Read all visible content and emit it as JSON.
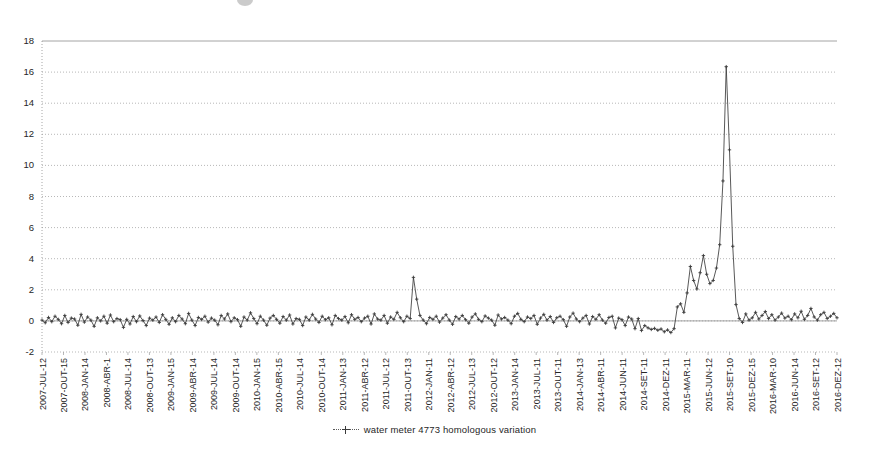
{
  "chart_data": {
    "type": "line",
    "title": "",
    "xlabel": "",
    "ylabel": "",
    "ylim": [
      -2,
      18
    ],
    "yticks": [
      -2,
      0,
      2,
      4,
      6,
      8,
      10,
      12,
      14,
      16,
      18
    ],
    "grid": true,
    "legend_position": "bottom",
    "series": [
      {
        "name": "water meter 4773 homologous variation",
        "marker": "cross",
        "color": "#3b3b3b",
        "values": [
          0.05,
          -0.12,
          0.22,
          -0.05,
          0.3,
          0.1,
          -0.18,
          0.35,
          -0.1,
          0.18,
          0.12,
          -0.28,
          0.42,
          -0.08,
          0.25,
          0.05,
          -0.35,
          0.2,
          0.0,
          0.3,
          -0.15,
          0.38,
          -0.05,
          0.15,
          0.08,
          -0.42,
          0.1,
          -0.2,
          0.28,
          -0.05,
          0.32,
          0.02,
          -0.3,
          0.18,
          0.05,
          0.25,
          -0.1,
          0.4,
          0.1,
          -0.22,
          0.2,
          -0.05,
          0.35,
          0.12,
          -0.18,
          0.48,
          0.05,
          -0.3,
          0.22,
          0.1,
          0.3,
          -0.08,
          0.18,
          0.05,
          -0.25,
          0.35,
          0.12,
          0.45,
          -0.05,
          0.2,
          0.08,
          -0.35,
          0.25,
          0.05,
          0.52,
          0.15,
          -0.18,
          0.3,
          0.05,
          -0.28,
          0.18,
          0.35,
          0.1,
          -0.15,
          0.28,
          0.05,
          0.38,
          -0.2,
          0.15,
          0.1,
          -0.3,
          0.25,
          0.05,
          0.42,
          0.12,
          -0.1,
          0.3,
          0.08,
          0.2,
          -0.25,
          0.35,
          0.15,
          0.05,
          0.28,
          -0.12,
          0.4,
          0.1,
          0.22,
          -0.05,
          0.18,
          0.3,
          -0.2,
          0.45,
          0.12,
          0.05,
          0.35,
          -0.15,
          0.25,
          0.1,
          0.55,
          0.2,
          -0.05,
          0.3,
          0.15,
          2.8,
          1.4,
          0.35,
          0.05,
          -0.18,
          0.22,
          0.1,
          0.3,
          -0.08,
          0.18,
          0.4,
          0.05,
          -0.22,
          0.28,
          0.12,
          0.35,
          0.08,
          -0.15,
          0.25,
          0.45,
          0.1,
          -0.05,
          0.32,
          0.18,
          0.05,
          -0.28,
          0.38,
          0.12,
          0.22,
          0.05,
          -0.18,
          0.3,
          0.48,
          0.1,
          -0.05,
          0.25,
          0.15,
          0.35,
          -0.22,
          0.18,
          0.42,
          0.05,
          0.28,
          -0.1,
          0.2,
          0.3,
          0.08,
          -0.35,
          0.25,
          0.5,
          0.12,
          -0.05,
          0.18,
          0.35,
          -0.2,
          0.28,
          0.1,
          0.4,
          0.05,
          -0.15,
          0.22,
          0.3,
          -0.45,
          0.18,
          0.08,
          -0.3,
          0.25,
          0.12,
          -0.5,
          0.15,
          -0.62,
          -0.3,
          -0.45,
          -0.55,
          -0.48,
          -0.6,
          -0.52,
          -0.7,
          -0.58,
          -0.75,
          -0.5,
          0.9,
          1.1,
          0.55,
          1.8,
          3.5,
          2.6,
          2.05,
          3.1,
          4.2,
          3.0,
          2.4,
          2.6,
          3.4,
          4.9,
          9.0,
          16.35,
          11.0,
          4.8,
          1.05,
          0.15,
          -0.1,
          0.45,
          0.05,
          0.2,
          0.55,
          0.12,
          0.35,
          0.6,
          0.15,
          0.4,
          0.05,
          0.25,
          0.5,
          0.18,
          0.3,
          0.08,
          0.45,
          0.2,
          0.62,
          0.1,
          0.35,
          0.8,
          0.25,
          0.05,
          0.4,
          0.55,
          0.15,
          0.3,
          0.48,
          0.2
        ]
      }
    ],
    "x_tick_labels": [
      "2007-JUL-12",
      "2007-OUT-15",
      "2008-JAN-14",
      "2008-ABR-1",
      "2008-JUL-14",
      "2008-OUT-13",
      "2009-JAN-15",
      "2009-ABR-14",
      "2009-JUL-14",
      "2009-OUT-14",
      "2010-JAN-15",
      "2010-ABR-15",
      "2010-JUL-14",
      "2010-OUT-14",
      "2011-JAN-13",
      "2011-ABR-12",
      "2011-JUL-12",
      "2011-OUT-13",
      "2012-JAN-11",
      "2012-ABR-12",
      "2012-JUL-13",
      "2012-OUT-12",
      "2013-JAN-14",
      "2013-JUL-11",
      "2013-OUT-11",
      "2014-JAN-13",
      "2014-ABR-11",
      "2014-JUN-11",
      "2014-SET-11",
      "2014-DEZ-11",
      "2015-MAR-11",
      "2015-JUN-12",
      "2015-SET-10",
      "2015-DEZ-15",
      "2016-MAR-10",
      "2016-JUN-14",
      "2016-SET-12",
      "2016-DEZ-12"
    ],
    "legend": [
      {
        "label": "water meter 4773 homologous variation"
      }
    ]
  },
  "legend": {
    "entry_label": "water meter 4773 homologous variation"
  }
}
